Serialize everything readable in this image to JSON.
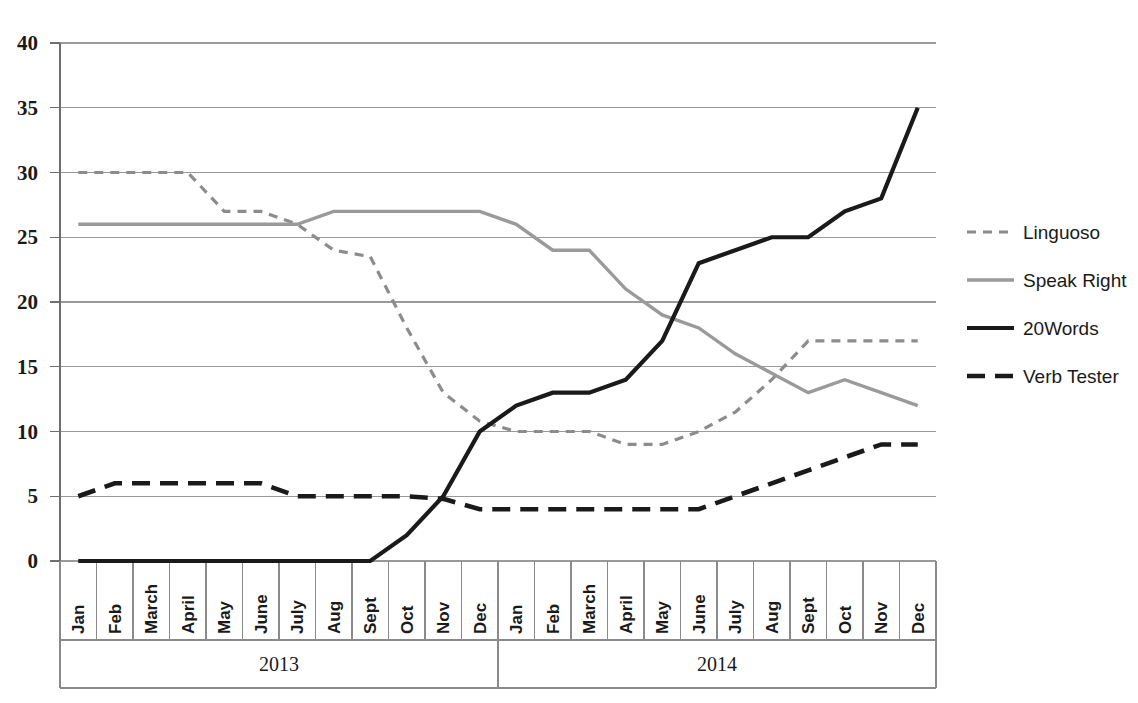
{
  "chart_data": {
    "type": "line",
    "title": "",
    "xlabel": "",
    "ylabel": "",
    "ylim": [
      0,
      40
    ],
    "ytick_step": 5,
    "grid": true,
    "legend_position": "right",
    "yticks": [
      "0",
      "5",
      "10",
      "15",
      "20",
      "25",
      "30",
      "35",
      "40"
    ],
    "categories": [
      "Jan",
      "Feb",
      "March",
      "April",
      "May",
      "June",
      "July",
      "Aug",
      "Sept",
      "Oct",
      "Nov",
      "Dec",
      "Jan",
      "Feb",
      "March",
      "April",
      "May",
      "June",
      "July",
      "Aug",
      "Sept",
      "Oct",
      "Nov",
      "Dec"
    ],
    "group_labels": [
      "2013",
      "2014"
    ],
    "group_spans": [
      12,
      12
    ],
    "series": [
      {
        "name": "Linguoso",
        "style": "dashed-light",
        "color": "#8c8c8c",
        "values": [
          30,
          30,
          30,
          30,
          27,
          27,
          26,
          24,
          23.5,
          18,
          13,
          10.8,
          10,
          10,
          10,
          9,
          9,
          10,
          11.5,
          14,
          17,
          17,
          17,
          17
        ]
      },
      {
        "name": "Speak Right",
        "style": "solid-gray",
        "color": "#9a9a9a",
        "values": [
          26,
          26,
          26,
          26,
          26,
          26,
          26,
          27,
          27,
          27,
          27,
          27,
          26,
          24,
          24,
          21,
          19,
          18,
          16,
          14.5,
          13,
          14,
          13,
          12
        ]
      },
      {
        "name": "20Words",
        "style": "solid-black",
        "color": "#1a1a1a",
        "values": [
          0,
          0,
          0,
          0,
          0,
          0,
          0,
          0,
          0,
          2,
          5,
          10,
          12,
          13,
          13,
          14,
          17,
          23,
          24,
          25,
          25,
          27,
          28,
          35
        ]
      },
      {
        "name": "Verb Tester",
        "style": "dashed-black",
        "color": "#1a1a1a",
        "values": [
          5,
          6,
          6,
          6,
          6,
          6,
          5,
          5,
          5,
          5,
          4.8,
          4,
          4,
          4,
          4,
          4,
          4,
          4,
          5,
          6,
          7,
          8,
          9,
          9
        ]
      }
    ]
  },
  "legend": {
    "items": [
      {
        "label": "Linguoso"
      },
      {
        "label": "Speak Right"
      },
      {
        "label": "20Words"
      },
      {
        "label": "Verb Tester"
      }
    ]
  },
  "axis": {
    "y_max_label": "40",
    "y_min_label": "0"
  }
}
